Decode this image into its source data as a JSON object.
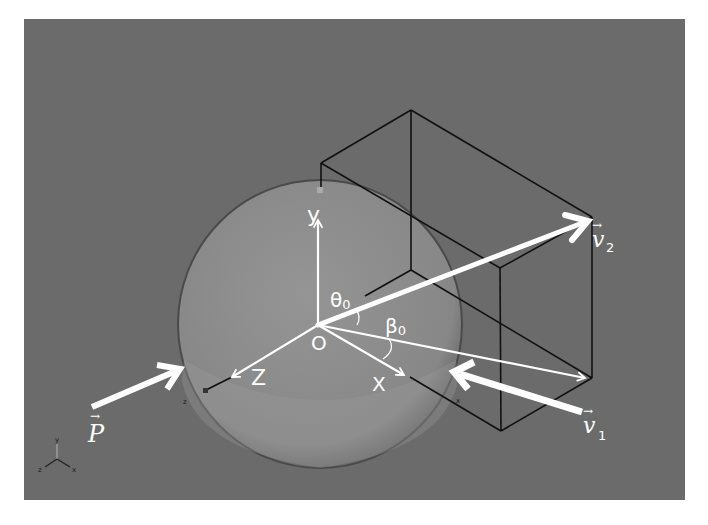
{
  "figure": {
    "background_color": "#ffffff",
    "panel_color": "#6b6b6b",
    "sphere_color": "#8c8c8c",
    "arrow_color": "#ffffff",
    "box_line_color": "#111111"
  },
  "axes": {
    "origin_label": "O",
    "x_label": "X",
    "y_label": "y",
    "z_label": "Z"
  },
  "angles": {
    "theta": "θ",
    "theta_sub": "0",
    "beta": "β",
    "beta_sub": "0"
  },
  "vectors": {
    "p": {
      "symbol": "P",
      "accent": "→"
    },
    "v1": {
      "symbol": "v",
      "sub": "1",
      "accent": "→"
    },
    "v2": {
      "symbol": "v",
      "sub": "2",
      "accent": "→"
    }
  },
  "tick_labels": {
    "z": "z",
    "x": "x"
  },
  "triad": {
    "y": "y",
    "x": "x",
    "z": "z"
  }
}
